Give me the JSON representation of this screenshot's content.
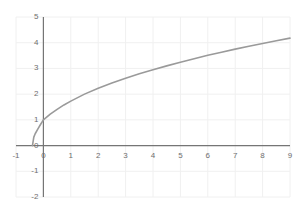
{
  "chart_data": {
    "type": "line",
    "title": "",
    "subtitle": "",
    "xlabel": "",
    "ylabel": "",
    "xlim": [
      -1,
      9
    ],
    "ylim": [
      -2,
      5
    ],
    "grid": true,
    "legend": null,
    "x_ticks": [
      -1,
      0,
      1,
      2,
      3,
      4,
      5,
      6,
      7,
      8,
      9
    ],
    "x_tick_labels": [
      "-1",
      "0",
      "1",
      "2",
      "3",
      "4",
      "5",
      "6",
      "7",
      "8",
      "9"
    ],
    "y_ticks": [
      -2,
      -1,
      0,
      1,
      2,
      3,
      4,
      5
    ],
    "y_tick_labels": [
      "-2",
      "-1",
      "0",
      "1",
      "2",
      "3",
      "4",
      "5"
    ],
    "series": [
      {
        "name": "curve",
        "color": "#9a9a9a",
        "line_width": 1.6,
        "x": [
          -0.4,
          -0.35,
          -0.3,
          -0.2,
          -0.1,
          0.0,
          0.25,
          0.5,
          0.75,
          1.0,
          1.5,
          2.0,
          2.5,
          3.0,
          3.5,
          4.0,
          4.5,
          5.0,
          5.5,
          6.0,
          6.5,
          7.0,
          7.5,
          8.0,
          8.5,
          9.0
        ],
        "y": [
          0.0,
          0.33,
          0.46,
          0.65,
          0.83,
          1.0,
          1.22,
          1.41,
          1.58,
          1.73,
          2.0,
          2.23,
          2.43,
          2.62,
          2.79,
          2.95,
          3.1,
          3.24,
          3.38,
          3.51,
          3.63,
          3.75,
          3.86,
          3.97,
          4.08,
          4.18
        ]
      }
    ],
    "axis_color": "#757575",
    "grid_color": "#f0f0f0",
    "tick_label_color": "#6e6e6e",
    "background_color": "#ffffff"
  }
}
